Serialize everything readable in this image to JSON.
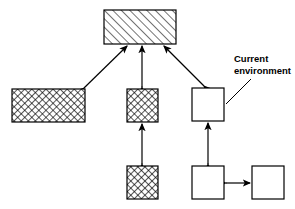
{
  "diagram": {
    "background_color": "#ffffff",
    "stroke_color": "#000000",
    "annotation": {
      "line1": "Current",
      "line2": "environment"
    },
    "nodes": [
      {
        "id": "top-node",
        "name": "top-hatched-box",
        "fill_style": "diagonal-hatch",
        "x": 104,
        "y": 10,
        "width": 72,
        "height": 34,
        "label": ""
      },
      {
        "id": "left-node",
        "name": "left-crosshatched-box",
        "fill_style": "cross-hatch",
        "x": 12,
        "y": 89,
        "width": 73,
        "height": 33,
        "label": ""
      },
      {
        "id": "middle-node",
        "name": "middle-crosshatched-box",
        "fill_style": "cross-hatch",
        "x": 127,
        "y": 89,
        "width": 31,
        "height": 33,
        "label": ""
      },
      {
        "id": "middle-lower-node",
        "name": "middle-lower-crosshatched-box",
        "fill_style": "cross-hatch",
        "x": 127,
        "y": 166,
        "width": 31,
        "height": 33,
        "label": ""
      },
      {
        "id": "current-env-node",
        "name": "current-environment-box",
        "fill_style": "plain",
        "x": 192,
        "y": 88,
        "width": 32,
        "height": 33,
        "label": ""
      },
      {
        "id": "bottom-left-plain-node",
        "name": "bottom-left-plain-box",
        "fill_style": "plain",
        "x": 192,
        "y": 166,
        "width": 32,
        "height": 33,
        "label": ""
      },
      {
        "id": "bottom-right-plain-node",
        "name": "bottom-right-plain-box",
        "fill_style": "plain",
        "x": 252,
        "y": 166,
        "width": 32,
        "height": 33,
        "label": ""
      }
    ],
    "connectors": [
      {
        "id": "top-to-left",
        "name": "connector-top-to-left",
        "type": "double-arrow",
        "from": "left-node",
        "to": "top-node"
      },
      {
        "id": "top-to-middle",
        "name": "connector-top-to-middle",
        "type": "double-arrow",
        "from": "middle-node",
        "to": "top-node"
      },
      {
        "id": "top-to-current-env",
        "name": "connector-top-to-current-environment",
        "type": "double-arrow",
        "from": "current-env-node",
        "to": "top-node"
      },
      {
        "id": "middle-to-middle-lower",
        "name": "connector-middle-to-middle-lower",
        "type": "double-arrow",
        "from": "middle-lower-node",
        "to": "middle-node"
      },
      {
        "id": "current-env-to-bottom-left",
        "name": "connector-current-environment-to-bottom-left",
        "type": "double-arrow",
        "from": "bottom-left-plain-node",
        "to": "current-env-node"
      },
      {
        "id": "bottom-left-to-bottom-right",
        "name": "connector-bottom-left-to-bottom-right",
        "type": "double-arrow",
        "from": "bottom-left-plain-node",
        "to": "bottom-right-plain-node"
      },
      {
        "id": "callout-leader",
        "name": "callout-leader-line",
        "type": "plain-line",
        "from": "current-env-annotation",
        "to": "current-env-node"
      }
    ]
  }
}
